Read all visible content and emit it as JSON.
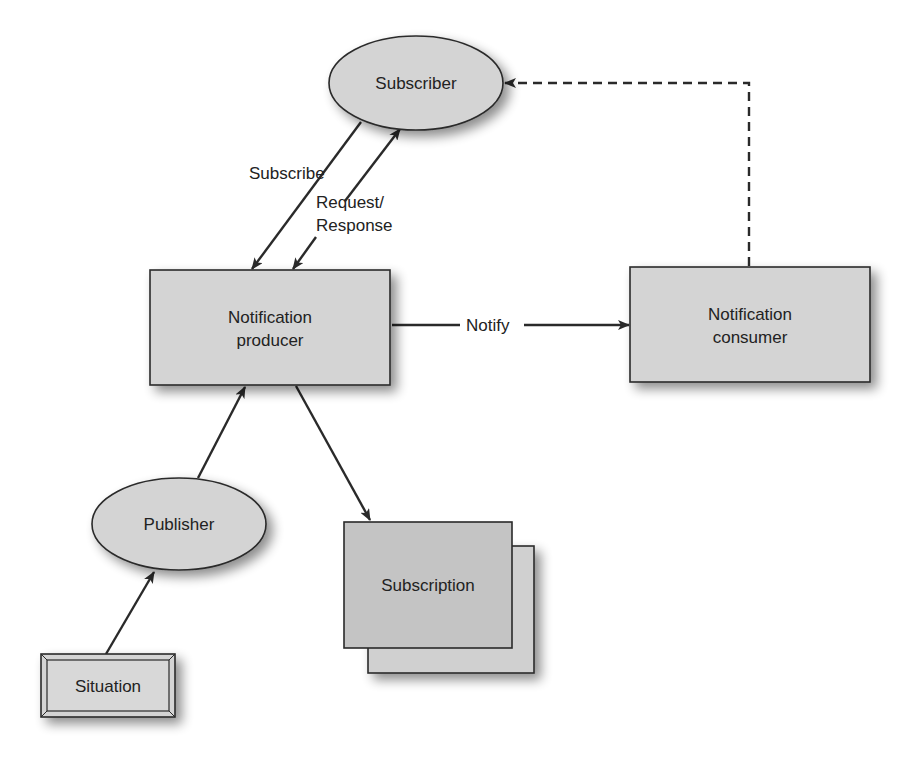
{
  "diagram": {
    "type": "flow",
    "colors": {
      "node_fill": "#d4d4d4",
      "subscription_fill": "#c4c4c4",
      "stroke": "#2a2a2a",
      "text": "#222222",
      "background": "#ffffff"
    },
    "nodes": {
      "subscriber": {
        "label": "Subscriber",
        "shape": "ellipse"
      },
      "producer": {
        "label_line1": "Notification",
        "label_line2": "producer",
        "shape": "rectangle"
      },
      "consumer": {
        "label_line1": "Notification",
        "label_line2": "consumer",
        "shape": "rectangle"
      },
      "publisher": {
        "label": "Publisher",
        "shape": "ellipse"
      },
      "subscription": {
        "label": "Subscription",
        "shape": "stacked-rectangle"
      },
      "situation": {
        "label": "Situation",
        "shape": "beveled-rectangle"
      }
    },
    "edges": {
      "subscribe": {
        "label": "Subscribe",
        "from": "Subscriber",
        "to": "Notification producer",
        "style": "solid"
      },
      "request_response": {
        "label_line1": "Request/",
        "label_line2": "Response",
        "from": "Notification producer",
        "to": "Subscriber",
        "style": "solid",
        "bidirectional": true
      },
      "notify": {
        "label": "Notify",
        "from": "Notification producer",
        "to": "Notification consumer",
        "style": "solid"
      },
      "consumer_to_subscriber": {
        "label": "",
        "from": "Notification consumer",
        "to": "Subscriber",
        "style": "dashed"
      },
      "publisher_to_producer": {
        "label": "",
        "from": "Publisher",
        "to": "Notification producer",
        "style": "solid"
      },
      "producer_to_subscription": {
        "label": "",
        "from": "Notification producer",
        "to": "Subscription",
        "style": "solid"
      },
      "situation_to_publisher": {
        "label": "",
        "from": "Situation",
        "to": "Publisher",
        "style": "solid"
      }
    }
  }
}
